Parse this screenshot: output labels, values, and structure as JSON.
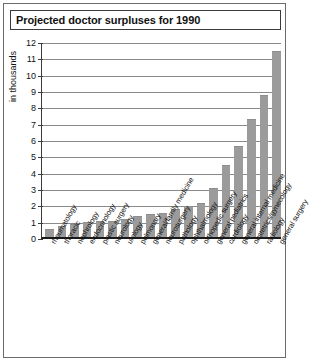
{
  "figure": {
    "title": "Projected doctor surpluses for 1990",
    "accent_color": "#9b9b9b",
    "frame_color": "#6b6b6b"
  },
  "chart_data": {
    "type": "bar",
    "title": "Projected doctor surpluses for 1990",
    "xlabel": "",
    "ylabel": "in thousands",
    "ylim": [
      0,
      12
    ],
    "yticks": [
      0,
      1,
      2,
      3,
      4,
      5,
      6,
      7,
      8,
      9,
      10,
      11,
      12
    ],
    "ytick_labels": [
      "0",
      "1",
      "2",
      "3",
      "4",
      "5",
      "6",
      "7",
      "8",
      "9",
      "10",
      "11",
      "12"
    ],
    "grid": true,
    "legend": null,
    "bar_color": "#9b9b9b",
    "categories": [
      "rheumatology",
      "thoracic",
      "nephrology",
      "endocrinology",
      "plastic surgery",
      "neurology",
      "urology",
      "pulmonary",
      "general/family medicine",
      "neurosurgery",
      "pathology",
      "ophthalmology",
      "orthopedic surgery",
      "general pediatrics",
      "cardiology",
      "general internal medicine",
      "obstetrics/gynecology",
      "radiology",
      "general surgery"
    ],
    "values": [
      0.5,
      0.7,
      0.8,
      0.9,
      0.95,
      1.0,
      1.1,
      1.3,
      1.4,
      1.5,
      1.7,
      1.9,
      2.1,
      3.0,
      4.4,
      5.6,
      7.2,
      8.7,
      11.4
    ]
  }
}
